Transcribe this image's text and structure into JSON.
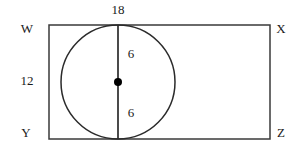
{
  "figure": {
    "type": "geometry-diagram",
    "stroke_color": "#3a3a3a",
    "fill_color": "#ffffff",
    "dot_color": "#000000",
    "rectangle": {
      "name": "WXYZ",
      "x": 49,
      "y": 25,
      "width": 221,
      "height": 114,
      "vertices": [
        {
          "id": "W",
          "label": "W",
          "corner": "top-left",
          "label_x": 27,
          "label_y": 28
        },
        {
          "id": "X",
          "label": "X",
          "corner": "top-right",
          "label_x": 281,
          "label_y": 28
        },
        {
          "id": "Y",
          "label": "Y",
          "corner": "bottom-left",
          "label_x": 26,
          "label_y": 132
        },
        {
          "id": "Z",
          "label": "Z",
          "corner": "bottom-right",
          "label_x": 281,
          "label_y": 132
        }
      ]
    },
    "circle": {
      "center_x": 118,
      "center_y": 82,
      "radius": 57,
      "center_dot_radius": 4
    },
    "diameter_line": {
      "x": 118,
      "y1": 25,
      "y2": 139
    },
    "measurements": [
      {
        "id": "top-width",
        "value": "18",
        "x": 118,
        "y": 9,
        "refers_to": "rectangle-width"
      },
      {
        "id": "left-height",
        "value": "12",
        "x": 27,
        "y": 80,
        "refers_to": "rectangle-height"
      },
      {
        "id": "upper-radius",
        "value": "6",
        "x": 131,
        "y": 53,
        "refers_to": "circle-radius-upper"
      },
      {
        "id": "lower-radius",
        "value": "6",
        "x": 131,
        "y": 112,
        "refers_to": "circle-radius-lower"
      }
    ]
  }
}
